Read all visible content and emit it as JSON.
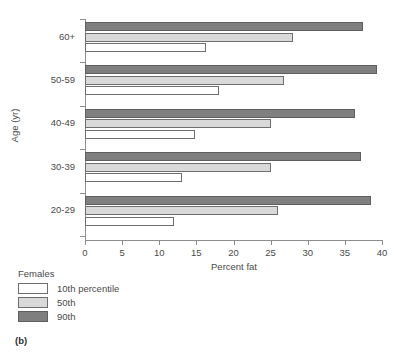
{
  "caption": "(b)",
  "chart_data": {
    "type": "bar",
    "orientation": "horizontal",
    "title": "",
    "xlabel": "Percent fat",
    "ylabel": "Age (yr)",
    "xlim": [
      0,
      40
    ],
    "xticks": [
      0,
      5,
      10,
      15,
      20,
      25,
      30,
      35,
      40
    ],
    "xtick_labels": [
      "0",
      "5",
      "10",
      "15",
      "20",
      "25",
      "30",
      "35",
      "40"
    ],
    "grid": false,
    "categories": [
      "20-29",
      "30-39",
      "40-49",
      "50-59",
      "60+"
    ],
    "category_order_top_to_bottom": [
      "60+",
      "50-59",
      "40-49",
      "30-39",
      "20-29"
    ],
    "legend": {
      "title": "Females",
      "position": "below-left",
      "entries": [
        {
          "label": "10th percentile",
          "color": "#ffffff",
          "series": "10th"
        },
        {
          "label": "50th",
          "color": "#d9d9d9",
          "series": "50th"
        },
        {
          "label": "90th",
          "color": "#7f7f7f",
          "series": "90th"
        }
      ]
    },
    "series": [
      {
        "name": "10th percentile",
        "color": "#ffffff",
        "values": [
          12.0,
          13.0,
          14.8,
          18.0,
          16.3
        ]
      },
      {
        "name": "50th",
        "color": "#d9d9d9",
        "values": [
          26.0,
          25.0,
          25.0,
          26.8,
          28.0
        ]
      },
      {
        "name": "90th",
        "color": "#7f7f7f",
        "values": [
          38.5,
          37.2,
          36.3,
          39.3,
          37.5
        ]
      }
    ]
  }
}
